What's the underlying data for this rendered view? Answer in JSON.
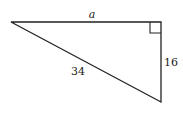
{
  "diagram": {
    "type": "right-triangle",
    "vertices": {
      "left": [
        11,
        22
      ],
      "right_angle": [
        161,
        22
      ],
      "bottom": [
        161,
        102
      ]
    },
    "labels": {
      "top_side": "a",
      "right_side": "16",
      "hypotenuse": "34"
    },
    "stroke_color": "#222222"
  }
}
